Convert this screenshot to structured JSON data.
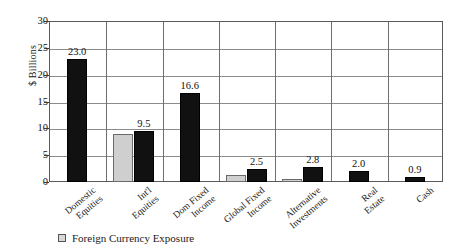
{
  "chart_data": {
    "type": "bar",
    "title": "",
    "xlabel": "",
    "ylabel": "$ Billions",
    "ylim": [
      0,
      30
    ],
    "yticks": [
      0,
      5,
      10,
      15,
      20,
      25,
      30
    ],
    "ytick_labels": [
      "0",
      "5",
      "10",
      "15",
      "20",
      "25",
      "30"
    ],
    "grid": "horizontal-and-vertical",
    "legend_position": "bottom-left",
    "categories": [
      "Domestic Equities",
      "Int'l Equities",
      "Dom Fixed Income",
      "Global Fixed Income",
      "Alternative Investments",
      "Real Estate",
      "Cash"
    ],
    "category_lines": [
      [
        "Domestic",
        "Equities"
      ],
      [
        "Int'l",
        "Equities"
      ],
      [
        "Dom Fixed",
        "Income"
      ],
      [
        "Global Fixed",
        "Income"
      ],
      [
        "Alternative",
        "Investments"
      ],
      [
        "Real",
        "Estate"
      ],
      [
        "Cash"
      ]
    ],
    "series": [
      {
        "name": "Foreign Currency Exposure",
        "color": "#cfcfcf",
        "values": [
          0,
          9.0,
          0,
          1.3,
          0.6,
          0,
          0
        ],
        "labels": [
          "",
          "",
          "",
          "",
          "",
          "",
          ""
        ]
      },
      {
        "name": "Total Assets",
        "color": "#111111",
        "values": [
          23.0,
          9.5,
          16.6,
          2.5,
          2.8,
          2.0,
          0.9
        ],
        "labels": [
          "23.0",
          "9.5",
          "16.6",
          "2.5",
          "2.8",
          "2.0",
          "0.9"
        ]
      }
    ]
  },
  "legend": {
    "items": [
      {
        "label": "Foreign Currency Exposure",
        "swatch": "#d8d8d8"
      }
    ]
  },
  "axis": {
    "y_title": "$ Billions"
  }
}
